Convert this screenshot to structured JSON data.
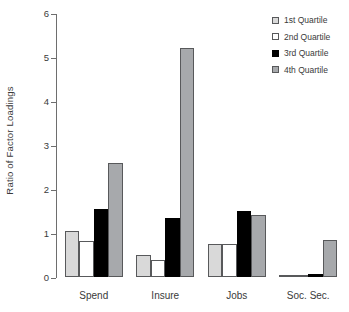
{
  "chart_data": {
    "type": "bar",
    "title": "",
    "xlabel": "",
    "ylabel": "Ratio of Factor Loadings",
    "ylim": [
      0,
      6
    ],
    "yticks": [
      0,
      1,
      2,
      3,
      4,
      5,
      6
    ],
    "ytick_labels": [
      "0",
      "1",
      "2",
      "3",
      "4",
      "5",
      "6"
    ],
    "grid": false,
    "legend_position": "top-right",
    "categories": [
      "Spend",
      "Insure",
      "Jobs",
      "Soc. Sec."
    ],
    "series": [
      {
        "name": "1st Quartile",
        "color": "#d9d9d9",
        "values": [
          1.05,
          0.5,
          0.75,
          0.02
        ]
      },
      {
        "name": "2nd Quartile",
        "color": "#ffffff",
        "values": [
          0.82,
          0.38,
          0.75,
          0.02
        ]
      },
      {
        "name": "3rd Quartile",
        "color": "#000000",
        "values": [
          1.55,
          1.35,
          1.5,
          0.07
        ]
      },
      {
        "name": "4th Quartile",
        "color": "#a7a9ac",
        "values": [
          2.6,
          5.2,
          1.42,
          0.83
        ]
      }
    ]
  },
  "legend": {
    "items": [
      {
        "label": "1st Quartile",
        "swatch": "light-gray-swatch"
      },
      {
        "label": "2nd Quartile",
        "swatch": "white-swatch"
      },
      {
        "label": "3rd Quartile",
        "swatch": "black-swatch"
      },
      {
        "label": "4th Quartile",
        "swatch": "medium-gray-swatch"
      }
    ]
  }
}
